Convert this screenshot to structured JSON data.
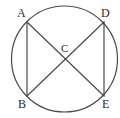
{
  "figure": {
    "kind": "geometry-diagram",
    "width": 120,
    "height": 118,
    "background_color": "#ffffff",
    "stroke_color": "#4a4a4a",
    "label_color": "#2b2b2b",
    "stroke_width": 1.2,
    "circle": {
      "cx": 64.5,
      "cy": 59,
      "r": 53
    },
    "points": [
      {
        "id": "A",
        "label": "A",
        "x": 27,
        "y": 22,
        "label_x": 17,
        "label_y": 7
      },
      {
        "id": "D",
        "label": "D",
        "x": 104,
        "y": 22,
        "label_x": 101,
        "label_y": 7
      },
      {
        "id": "C",
        "label": "C",
        "x": 65,
        "y": 59,
        "label_x": 61,
        "label_y": 43
      },
      {
        "id": "B",
        "label": "B",
        "x": 27,
        "y": 96,
        "label_x": 18,
        "label_y": 98
      },
      {
        "id": "E",
        "label": "E",
        "x": 104,
        "y": 96,
        "label_x": 102,
        "label_y": 98
      }
    ],
    "segments": [
      {
        "id": "AB",
        "from": "A",
        "to": "B",
        "x1": 27,
        "y1": 22,
        "x2": 27,
        "y2": 96
      },
      {
        "id": "DE",
        "from": "D",
        "to": "E",
        "x1": 104,
        "y1": 22,
        "x2": 104,
        "y2": 96
      },
      {
        "id": "AE",
        "from": "A",
        "to": "E",
        "x1": 27,
        "y1": 22,
        "x2": 104,
        "y2": 96
      },
      {
        "id": "DB",
        "from": "D",
        "to": "B",
        "x1": 104,
        "y1": 22,
        "x2": 27,
        "y2": 96
      }
    ]
  }
}
